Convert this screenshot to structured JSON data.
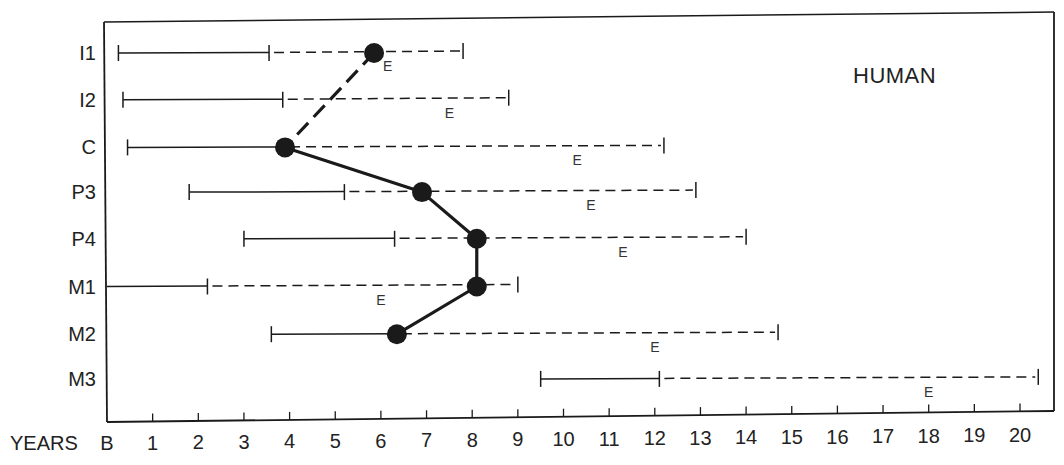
{
  "chart_data": {
    "type": "range-timeline",
    "title": "HUMAN",
    "xlabel": "YEARS",
    "x_origin_label": "B",
    "xlim": [
      0,
      20.5
    ],
    "x_ticks": [
      1,
      2,
      3,
      4,
      5,
      6,
      7,
      8,
      9,
      10,
      11,
      12,
      13,
      14,
      15,
      16,
      17,
      18,
      19,
      20
    ],
    "x_tick_labels": [
      "B",
      "1",
      "2",
      "3",
      "4",
      "5",
      "6",
      "7",
      "8",
      "9",
      "10",
      "11",
      "12",
      "13",
      "14",
      "15",
      "16",
      "17",
      "18",
      "19",
      "20"
    ],
    "marker_label": "E",
    "grid": false,
    "rows": [
      {
        "label": "I1",
        "solid_start": 0.25,
        "solid_end": 3.55,
        "dashed_end": 7.8,
        "e": 6.15,
        "dot": 5.85
      },
      {
        "label": "I2",
        "solid_start": 0.35,
        "solid_end": 3.85,
        "dashed_end": 8.8,
        "e": 7.5,
        "dot": null
      },
      {
        "label": "C",
        "solid_start": 0.45,
        "solid_end": 3.9,
        "dashed_end": 12.2,
        "e": 10.3,
        "dot": 3.9
      },
      {
        "label": "P3",
        "solid_start": 1.8,
        "solid_end": 5.2,
        "dashed_end": 12.9,
        "e": 10.6,
        "dot": 6.9
      },
      {
        "label": "P4",
        "solid_start": 3.0,
        "solid_end": 6.3,
        "dashed_end": 14.0,
        "e": 11.3,
        "dot": 8.1
      },
      {
        "label": "M1",
        "solid_start": 0.0,
        "solid_end": 2.2,
        "dashed_end": 9.0,
        "e": 6.0,
        "dot": 8.1
      },
      {
        "label": "M2",
        "solid_start": 3.6,
        "solid_end": 6.35,
        "dashed_end": 14.7,
        "e": 12.0,
        "dot": 6.35
      },
      {
        "label": "M3",
        "solid_start": 9.5,
        "solid_end": 12.1,
        "dashed_end": 20.4,
        "e": 18.0,
        "dot": null
      }
    ],
    "connecting_line": {
      "points": [
        [
          "I1",
          5.85
        ],
        [
          "C",
          3.9
        ],
        [
          "P3",
          6.9
        ],
        [
          "P4",
          8.1
        ],
        [
          "M1",
          8.1
        ],
        [
          "M2",
          6.35
        ]
      ],
      "dashed_segment": [
        "I1",
        "C"
      ]
    }
  },
  "colors": {
    "ink": "#1a1a1a",
    "background": "#ffffff"
  }
}
